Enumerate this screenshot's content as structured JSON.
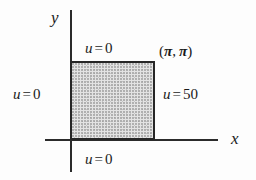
{
  "figure": {
    "type": "boundary-value-problem-diagram",
    "axes": {
      "y_label": "y",
      "x_label": "x"
    },
    "region": {
      "fill_color": "#e3e3e3",
      "border_color": "#262626",
      "corner_label": {
        "open_paren": "(",
        "first": "π",
        "comma": ",",
        "second": "π",
        "close_paren": ")",
        "full": "(π, π)"
      }
    },
    "boundary_conditions": [
      {
        "position": "top",
        "variable": "u",
        "operator": "=",
        "value": "0",
        "full": "u = 0"
      },
      {
        "position": "left",
        "variable": "u",
        "operator": "=",
        "value": "0",
        "full": "u = 0"
      },
      {
        "position": "right",
        "variable": "u",
        "operator": "=",
        "value": "50",
        "full": "u = 50"
      },
      {
        "position": "bottom",
        "variable": "u",
        "operator": "=",
        "value": "0",
        "full": "u = 0"
      }
    ]
  }
}
